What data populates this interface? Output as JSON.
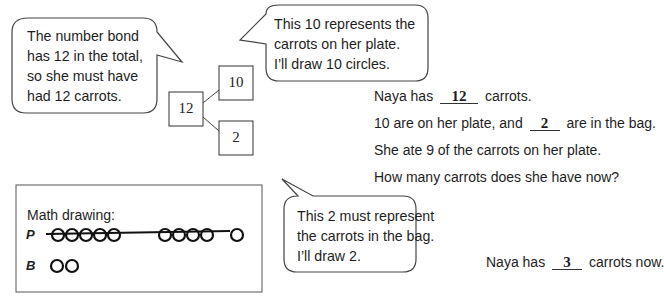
{
  "bubbles": {
    "total": {
      "lines": [
        "The number bond",
        "has 12 in the total,",
        "so she must have",
        "had 12 carrots."
      ]
    },
    "ten": {
      "lines": [
        "This 10 represents the",
        "carrots on her plate.",
        "I’ll draw 10 circles."
      ]
    },
    "two": {
      "lines": [
        "This 2 must represent",
        "the carrots in the bag.",
        "I’ll draw 2."
      ]
    }
  },
  "number_bond": {
    "whole": "12",
    "part_top": "10",
    "part_bottom": "2"
  },
  "story": {
    "line1": {
      "prefix": "Naya has",
      "answer": "12",
      "suffix": "carrots."
    },
    "line2": {
      "prefix": "10 are on her plate, and",
      "answer": "2",
      "suffix": "are in the bag."
    },
    "line3": "She ate 9 of the carrots on her plate.",
    "line4": "How many carrots does she have now?"
  },
  "math_drawing": {
    "title": "Math drawing:",
    "rows": [
      {
        "letter": "P",
        "circles": 10,
        "crossed_out": 9
      },
      {
        "letter": "B",
        "circles": 2,
        "crossed_out": 0
      }
    ]
  },
  "final_answer": {
    "prefix": "Naya has",
    "answer": "3",
    "suffix": "carrots now."
  }
}
